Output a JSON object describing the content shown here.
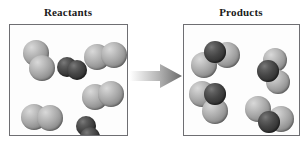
{
  "diagram": {
    "type": "chemical-reaction-particulate-diagram",
    "panels": [
      {
        "id": "reactants",
        "title": "Reactants",
        "molecules": [
          {
            "name": "light-diatomic-upper-left",
            "atoms": [
              {
                "shade": "light",
                "cx": 26,
                "cy": 28,
                "r": 13
              },
              {
                "shade": "light",
                "cx": 32,
                "cy": 43,
                "r": 13
              }
            ]
          },
          {
            "name": "dark-diatomic-upper-middle",
            "atoms": [
              {
                "shade": "dark",
                "cx": 57,
                "cy": 42,
                "r": 10
              },
              {
                "shade": "dark",
                "cx": 67,
                "cy": 45,
                "r": 10
              }
            ]
          },
          {
            "name": "light-diatomic-upper-right",
            "atoms": [
              {
                "shade": "light",
                "cx": 87,
                "cy": 32,
                "r": 13
              },
              {
                "shade": "light",
                "cx": 104,
                "cy": 30,
                "r": 13
              }
            ]
          },
          {
            "name": "light-diatomic-middle-right",
            "atoms": [
              {
                "shade": "light",
                "cx": 85,
                "cy": 72,
                "r": 13
              },
              {
                "shade": "light",
                "cx": 101,
                "cy": 69,
                "r": 13
              }
            ]
          },
          {
            "name": "light-diatomic-lower-left",
            "atoms": [
              {
                "shade": "light",
                "cx": 24,
                "cy": 92,
                "r": 13
              },
              {
                "shade": "light",
                "cx": 40,
                "cy": 93,
                "r": 13
              }
            ]
          },
          {
            "name": "dark-diatomic-lower-middle",
            "atoms": [
              {
                "shade": "dark",
                "cx": 76,
                "cy": 101,
                "r": 10
              },
              {
                "shade": "dark",
                "cx": 80,
                "cy": 112,
                "r": 10
              }
            ]
          }
        ]
      },
      {
        "id": "products",
        "title": "Products",
        "molecules": [
          {
            "name": "triatomic-upper-left",
            "atoms": [
              {
                "shade": "light",
                "cx": 20,
                "cy": 40,
                "r": 13
              },
              {
                "shade": "light",
                "cx": 43,
                "cy": 30,
                "r": 13
              },
              {
                "shade": "dark",
                "cx": 31,
                "cy": 27,
                "r": 11
              }
            ]
          },
          {
            "name": "triatomic-upper-right",
            "atoms": [
              {
                "shade": "light",
                "cx": 91,
                "cy": 35,
                "r": 12
              },
              {
                "shade": "light",
                "cx": 94,
                "cy": 57,
                "r": 12
              },
              {
                "shade": "dark",
                "cx": 84,
                "cy": 46,
                "r": 11
              }
            ]
          },
          {
            "name": "triatomic-lower-left",
            "atoms": [
              {
                "shade": "light",
                "cx": 18,
                "cy": 69,
                "r": 13
              },
              {
                "shade": "light",
                "cx": 31,
                "cy": 86,
                "r": 13
              },
              {
                "shade": "dark",
                "cx": 31,
                "cy": 69,
                "r": 11
              }
            ]
          },
          {
            "name": "triatomic-lower-right",
            "atoms": [
              {
                "shade": "light",
                "cx": 74,
                "cy": 84,
                "r": 13
              },
              {
                "shade": "light",
                "cx": 97,
                "cy": 94,
                "r": 13
              },
              {
                "shade": "dark",
                "cx": 85,
                "cy": 97,
                "r": 11
              }
            ]
          }
        ]
      }
    ],
    "arrow": {
      "name": "reaction-arrow",
      "direction": "right",
      "gradient_from": "#ffffff",
      "gradient_to": "#6a6a6a"
    },
    "colors": {
      "atom_light": "#a7a7a7",
      "atom_dark": "#3a3a3a",
      "box_border": "#6e6e72",
      "background": "#ffffff",
      "title_text": "#1a1a1a"
    }
  }
}
